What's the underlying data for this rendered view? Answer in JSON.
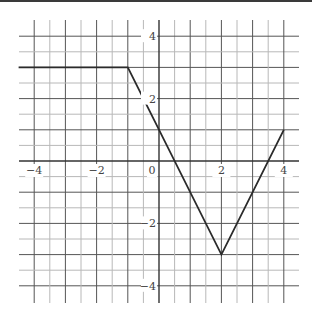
{
  "chart_data": {
    "type": "line",
    "title": "",
    "xlabel": "",
    "ylabel": "",
    "xlim": [
      -4.5,
      4.5
    ],
    "ylim": [
      -4.5,
      4.5
    ],
    "grid": true,
    "grid_step": 0.5,
    "x_ticks": [
      -4,
      -2,
      0,
      2,
      4
    ],
    "y_ticks": [
      4,
      2,
      -2,
      -4
    ],
    "x_tick_labels": [
      "−4",
      "−2",
      "0",
      "2",
      "4"
    ],
    "y_tick_labels": [
      "4",
      "2",
      "−2",
      "−4"
    ],
    "series": [
      {
        "name": "f(x)",
        "points": [
          [
            -4.5,
            3
          ],
          [
            -1,
            3
          ],
          [
            2,
            -3
          ],
          [
            4,
            1
          ]
        ]
      }
    ],
    "legend": null
  },
  "colors": {
    "axis": "#333333",
    "major_grid": "#555555",
    "minor_grid": "#b8b8b8",
    "line": "#2b2b2b",
    "label": "#444444"
  }
}
